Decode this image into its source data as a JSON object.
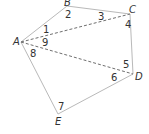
{
  "diagram": {
    "vertices": [
      {
        "name": "A",
        "x": 21,
        "y": 42,
        "label_x": 13,
        "label_y": 45
      },
      {
        "name": "B",
        "x": 67,
        "y": 6,
        "label_x": 64,
        "label_y": 6
      },
      {
        "name": "C",
        "x": 130,
        "y": 14,
        "label_x": 129,
        "label_y": 13
      },
      {
        "name": "D",
        "x": 133,
        "y": 74,
        "label_x": 135,
        "label_y": 80
      },
      {
        "name": "E",
        "x": 58,
        "y": 114,
        "label_x": 55,
        "label_y": 125
      }
    ],
    "edges": [
      {
        "from": "A",
        "to": "B",
        "style": "solid"
      },
      {
        "from": "B",
        "to": "C",
        "style": "solid"
      },
      {
        "from": "C",
        "to": "D",
        "style": "solid"
      },
      {
        "from": "D",
        "to": "E",
        "style": "solid"
      },
      {
        "from": "E",
        "to": "A",
        "style": "solid"
      },
      {
        "from": "A",
        "to": "C",
        "style": "dashed"
      },
      {
        "from": "A",
        "to": "D",
        "style": "dashed"
      }
    ],
    "angle_labels": [
      {
        "text": "1",
        "x": 43,
        "y": 33
      },
      {
        "text": "2",
        "x": 65,
        "y": 18
      },
      {
        "text": "3",
        "x": 98,
        "y": 20
      },
      {
        "text": "4",
        "x": 125,
        "y": 28
      },
      {
        "text": "5",
        "x": 123,
        "y": 68
      },
      {
        "text": "6",
        "x": 111,
        "y": 81
      },
      {
        "text": "7",
        "x": 58,
        "y": 110
      },
      {
        "text": "8",
        "x": 30,
        "y": 57
      },
      {
        "text": "9",
        "x": 42,
        "y": 46
      }
    ]
  }
}
